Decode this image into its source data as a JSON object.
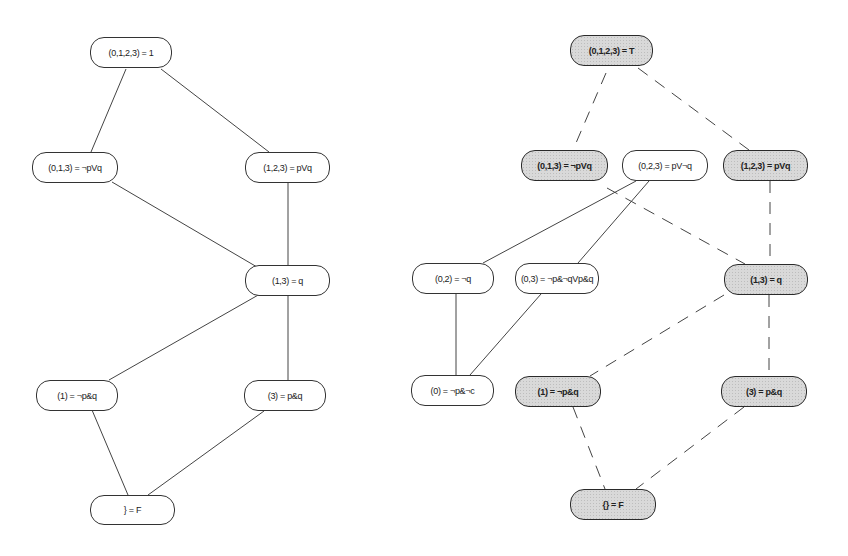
{
  "left_lattice": {
    "nodes": [
      {
        "id": "L0123",
        "label": "(0,1,2,3) = 1",
        "x": 90,
        "y": 37,
        "w": 82,
        "h": 31,
        "shaded": false
      },
      {
        "id": "L013",
        "label": "(0,1,3) = ¬pVq",
        "x": 32,
        "y": 152,
        "w": 86,
        "h": 31,
        "shaded": false
      },
      {
        "id": "L123",
        "label": "(1,2,3) = pVq",
        "x": 245,
        "y": 152,
        "w": 85,
        "h": 31,
        "shaded": false
      },
      {
        "id": "L13",
        "label": "(1,3) = q",
        "x": 245,
        "y": 265,
        "w": 85,
        "h": 31,
        "shaded": false
      },
      {
        "id": "L1",
        "label": "(1) = ¬p&q",
        "x": 36,
        "y": 380,
        "w": 82,
        "h": 31,
        "shaded": false
      },
      {
        "id": "L3",
        "label": "(3) = p&q",
        "x": 244,
        "y": 380,
        "w": 82,
        "h": 31,
        "shaded": false
      },
      {
        "id": "LF",
        "label": "} = F",
        "x": 90,
        "y": 495,
        "w": 85,
        "h": 30,
        "shaded": false
      }
    ],
    "edges": [
      {
        "from": "L0123",
        "to": "L013",
        "x1": 126,
        "y1": 69,
        "x2": 91,
        "y2": 152,
        "style": "solid"
      },
      {
        "from": "L0123",
        "to": "L123",
        "x1": 161,
        "y1": 69,
        "x2": 269,
        "y2": 152,
        "style": "solid"
      },
      {
        "from": "L013",
        "to": "L13",
        "x1": 112,
        "y1": 182,
        "x2": 257,
        "y2": 267,
        "style": "solid"
      },
      {
        "from": "L123",
        "to": "L13",
        "x1": 288,
        "y1": 183,
        "x2": 288,
        "y2": 265,
        "style": "solid"
      },
      {
        "from": "L13",
        "to": "L1",
        "x1": 260,
        "y1": 294,
        "x2": 109,
        "y2": 380,
        "style": "solid"
      },
      {
        "from": "L13",
        "to": "L3",
        "x1": 288,
        "y1": 296,
        "x2": 288,
        "y2": 380,
        "style": "solid"
      },
      {
        "from": "L1",
        "to": "LF",
        "x1": 92,
        "y1": 410,
        "x2": 128,
        "y2": 495,
        "style": "solid"
      },
      {
        "from": "L3",
        "to": "LF",
        "x1": 264,
        "y1": 411,
        "x2": 148,
        "y2": 495,
        "style": "solid"
      }
    ]
  },
  "right_lattice": {
    "nodes": [
      {
        "id": "R0123",
        "label": "(0,1,2,3) = T",
        "x": 570,
        "y": 35,
        "w": 83,
        "h": 31,
        "shaded": true
      },
      {
        "id": "R013",
        "label": "(0,1,3) = ¬pVq",
        "x": 521,
        "y": 150,
        "w": 87,
        "h": 31,
        "shaded": true
      },
      {
        "id": "R023",
        "label": "(0,2,3) = pV¬q",
        "x": 622,
        "y": 150,
        "w": 86,
        "h": 31,
        "shaded": false
      },
      {
        "id": "R123",
        "label": "(1,2,3) = pVq",
        "x": 723,
        "y": 150,
        "w": 85,
        "h": 31,
        "shaded": true
      },
      {
        "id": "R02",
        "label": "(0,2) = ¬q",
        "x": 412,
        "y": 263,
        "w": 82,
        "h": 31,
        "shaded": false
      },
      {
        "id": "R03",
        "label": "(0,3) = ¬p&¬qVp&q",
        "x": 515,
        "y": 263,
        "w": 84,
        "h": 31,
        "shaded": false
      },
      {
        "id": "R13",
        "label": "(1,3) = q",
        "x": 724,
        "y": 264,
        "w": 84,
        "h": 31,
        "shaded": true
      },
      {
        "id": "R0",
        "label": "(0) = ¬p&¬c",
        "x": 411,
        "y": 375,
        "w": 83,
        "h": 31,
        "shaded": false
      },
      {
        "id": "R1",
        "label": "(1) = ¬p&q",
        "x": 515,
        "y": 376,
        "w": 86,
        "h": 31,
        "shaded": true
      },
      {
        "id": "R3",
        "label": "(3) = p&q",
        "x": 721,
        "y": 376,
        "w": 86,
        "h": 31,
        "shaded": true
      },
      {
        "id": "RF",
        "label": "{} = F",
        "x": 570,
        "y": 489,
        "w": 86,
        "h": 31,
        "shaded": true
      }
    ],
    "edges": [
      {
        "from": "R0123",
        "to": "R013",
        "x1": 606,
        "y1": 73,
        "x2": 573,
        "y2": 150,
        "style": "dashed"
      },
      {
        "from": "R0123",
        "to": "R123",
        "x1": 638,
        "y1": 68,
        "x2": 749,
        "y2": 150,
        "style": "dashed"
      },
      {
        "from": "R023",
        "to": "R02",
        "x1": 636,
        "y1": 181,
        "x2": 483,
        "y2": 263,
        "style": "solid"
      },
      {
        "from": "R023",
        "to": "R03",
        "x1": 649,
        "y1": 181,
        "x2": 578,
        "y2": 263,
        "style": "solid"
      },
      {
        "from": "R013",
        "to": "R13",
        "x1": 607,
        "y1": 188,
        "x2": 745,
        "y2": 264,
        "style": "dashed"
      },
      {
        "from": "R123",
        "to": "R13",
        "x1": 770,
        "y1": 181,
        "x2": 770,
        "y2": 264,
        "style": "dashed"
      },
      {
        "from": "R02",
        "to": "R0",
        "x1": 456,
        "y1": 294,
        "x2": 456,
        "y2": 375,
        "style": "solid"
      },
      {
        "from": "R03",
        "to": "R0",
        "x1": 541,
        "y1": 294,
        "x2": 470,
        "y2": 375,
        "style": "solid"
      },
      {
        "from": "R13",
        "to": "R1",
        "x1": 724,
        "y1": 295,
        "x2": 590,
        "y2": 376,
        "style": "dashed"
      },
      {
        "from": "R13",
        "to": "R3",
        "x1": 769,
        "y1": 295,
        "x2": 769,
        "y2": 376,
        "style": "dashed"
      },
      {
        "from": "R1",
        "to": "RF",
        "x1": 573,
        "y1": 407,
        "x2": 605,
        "y2": 489,
        "style": "dashed"
      },
      {
        "from": "R3",
        "to": "RF",
        "x1": 744,
        "y1": 407,
        "x2": 636,
        "y2": 489,
        "style": "dashed"
      }
    ]
  },
  "colors": {
    "line": "#444444",
    "node_border": "#333333",
    "shaded_fill": "#d9d9d9",
    "background": "#ffffff"
  }
}
